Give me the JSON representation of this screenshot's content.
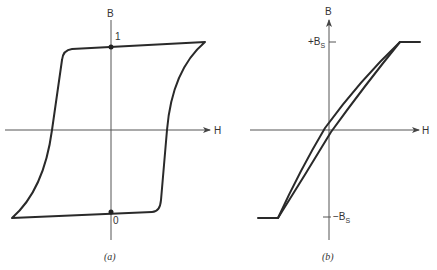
{
  "panels": [
    {
      "id": "a",
      "caption": "(a)",
      "title": "Square hysteresis loop",
      "x_axis_label": "H",
      "y_axis_label": "B",
      "points": [
        {
          "label": "1",
          "description": "remanent state, positive"
        },
        {
          "label": "0",
          "description": "remanent state, negative"
        }
      ]
    },
    {
      "id": "b",
      "caption": "(b)",
      "title": "Sheared (narrow) hysteresis loop with saturation",
      "x_axis_label": "H",
      "y_axis_label": "B",
      "tick_labels": {
        "positive_saturation": "+B",
        "positive_saturation_sub": "S",
        "negative_saturation": "−B",
        "negative_saturation_sub": "S"
      }
    }
  ],
  "colors": {
    "curve": "#2a2a2a",
    "axis": "#555555",
    "background": "#ffffff"
  }
}
